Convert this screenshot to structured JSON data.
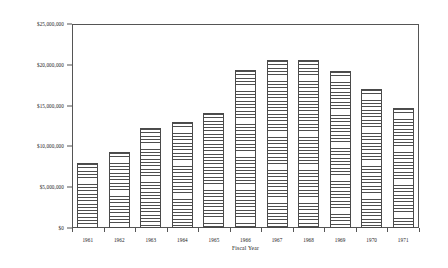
{
  "chart_data": {
    "type": "bar",
    "title": "",
    "xlabel": "Fiscal Year",
    "ylabel": "",
    "categories": [
      "1961",
      "1962",
      "1963",
      "1964",
      "1965",
      "1966",
      "1967",
      "1968",
      "1969",
      "1970",
      "1971"
    ],
    "values": [
      8000000,
      9300000,
      12200000,
      13000000,
      14100000,
      19400000,
      20600000,
      20600000,
      19200000,
      17000000,
      14700000
    ],
    "ylim": [
      0,
      25000000
    ],
    "ytick_values": [
      0,
      5000000,
      10000000,
      15000000,
      20000000,
      25000000
    ],
    "ytick_labels": [
      "$0",
      "$5,000,000",
      "$10,000,000",
      "$15,000,000",
      "$20,000,000",
      "$25,000,000"
    ],
    "grid": false,
    "legend": null,
    "series": [
      {
        "name": "Fiscal Year Amount",
        "values": [
          8000000,
          9300000,
          12200000,
          13000000,
          14100000,
          19400000,
          20600000,
          20600000,
          19200000,
          17000000,
          14700000
        ]
      }
    ],
    "bar_fill": "#fbfbfb",
    "bar_edge": "#4a4a4a",
    "hatch": "horizontal-lines",
    "frame_color": "#555555"
  },
  "axes": {
    "y": {
      "ticks": [
        {
          "label": "$25,000,000",
          "value": 25000000
        },
        {
          "label": "$20,000,000",
          "value": 20000000
        },
        {
          "label": "$15,000,000",
          "value": 15000000
        },
        {
          "label": "$10,000,000",
          "value": 10000000
        },
        {
          "label": "$5,000,000",
          "value": 5000000
        },
        {
          "label": "$0",
          "value": 0
        }
      ]
    },
    "x": {
      "title": "Fiscal Year",
      "ticks": [
        {
          "label": "1961"
        },
        {
          "label": "1962"
        },
        {
          "label": "1963"
        },
        {
          "label": "1964"
        },
        {
          "label": "1965"
        },
        {
          "label": "1966"
        },
        {
          "label": "1967"
        },
        {
          "label": "1968"
        },
        {
          "label": "1969"
        },
        {
          "label": "1970"
        },
        {
          "label": "1971"
        }
      ]
    }
  }
}
